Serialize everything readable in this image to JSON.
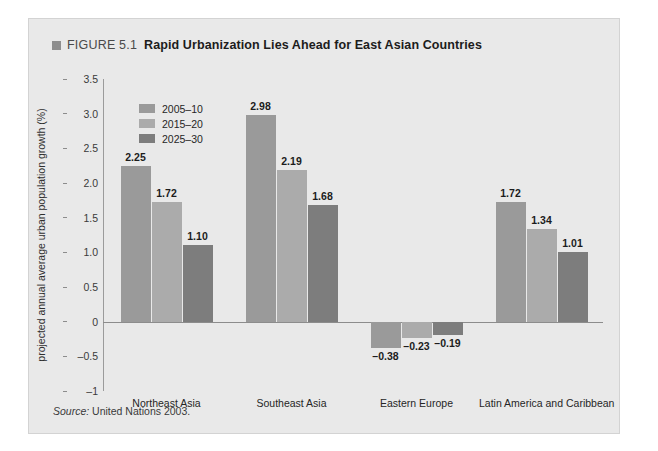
{
  "figure": {
    "marker_icon": "square-marker-icon",
    "number": "FIGURE 5.1",
    "title": "Rapid Urbanization Lies Ahead for East Asian Countries"
  },
  "source": {
    "label": "Source:",
    "text": " United Nations 2003."
  },
  "colors": {
    "panel_bg": "#e9e9e9",
    "series_1": "#9a9a9a",
    "series_2": "#ababab",
    "series_3": "#7d7d7d",
    "axis": "#8c8c8c",
    "text": "#1c1c1c"
  },
  "chart_data": {
    "type": "bar",
    "title": "Rapid Urbanization Lies Ahead for East Asian Countries",
    "xlabel": "",
    "ylabel": "projected annual average urban population growth (%)",
    "ylim": [
      -1,
      3.5
    ],
    "yticks": [
      "3.5",
      "3.0",
      "2.5",
      "2.0",
      "1.5",
      "1.0",
      "0.5",
      "0",
      "-0.5",
      "-1"
    ],
    "ytick_values": [
      3.5,
      3.0,
      2.5,
      2.0,
      1.5,
      1.0,
      0.5,
      0,
      -0.5,
      -1
    ],
    "grid": false,
    "legend_position": "top-left",
    "categories": [
      "Northeast Asia",
      "Southeast Asia",
      "Eastern Europe",
      "Latin America and Caribbean"
    ],
    "series": [
      {
        "name": "2005–10",
        "color": "#9a9a9a",
        "values": [
          2.25,
          2.98,
          -0.38,
          1.72
        ],
        "labels": [
          "2.25",
          "2.98",
          "–0.38",
          "1.72"
        ]
      },
      {
        "name": "2015–20",
        "color": "#ababab",
        "values": [
          1.72,
          2.19,
          -0.23,
          1.34
        ],
        "labels": [
          "1.72",
          "2.19",
          "–0.23",
          "1.34"
        ]
      },
      {
        "name": "2025–30",
        "color": "#7d7d7d",
        "values": [
          1.1,
          1.68,
          -0.19,
          1.01
        ],
        "labels": [
          "1.10",
          "1.68",
          "–0.19",
          "1.01"
        ]
      }
    ]
  }
}
